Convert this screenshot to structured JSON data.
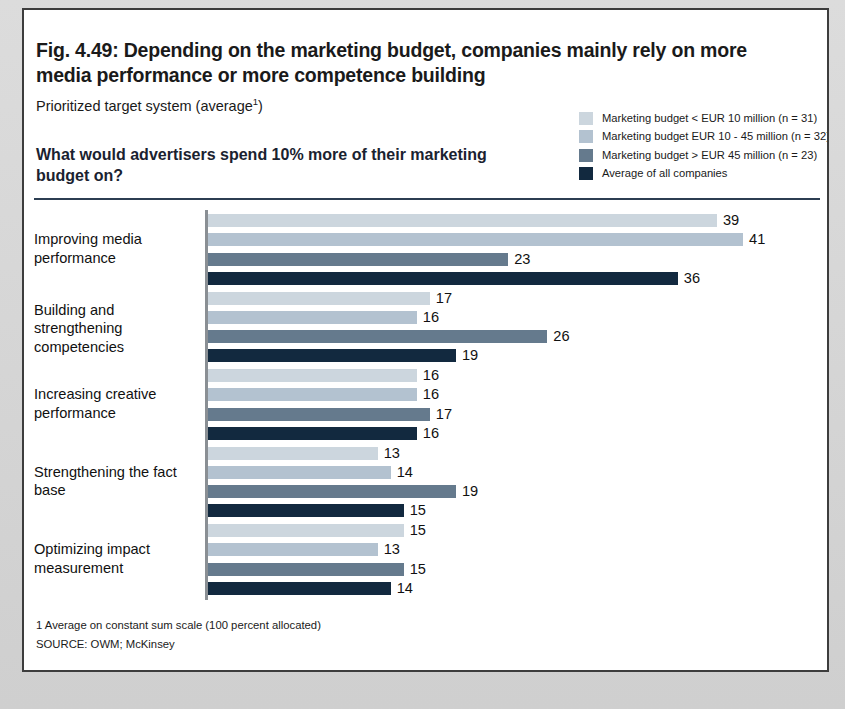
{
  "figure": {
    "title": "Fig. 4.49: Depending on the marketing budget, companies mainly rely on more media performance or more competence building",
    "subtitle_text": "Prioritized target system (average",
    "subtitle_sup": "1",
    "subtitle_tail": ")",
    "question": "What would advertisers spend 10% more of their marketing budget on?",
    "footnote_1": "1 Average on constant sum scale (100 percent allocated)",
    "footnote_source": "SOURCE: OWM; McKinsey"
  },
  "colors": {
    "series_1": "#ccd6de",
    "series_2": "#b3c2d0",
    "series_3": "#657a8d",
    "series_4": "#12293f",
    "divider": "#2c3e52",
    "axis": "#8a8f94",
    "card_border": "#3d3d3d",
    "page_background": "#d9d9d9"
  },
  "chart_data": {
    "type": "bar",
    "orientation": "horizontal",
    "title": "Fig. 4.49: Depending on the marketing budget, companies mainly rely on more media performance or more competence building",
    "subtitle": "Prioritized target system (average1)",
    "question": "What would advertisers spend 10% more of their marketing budget on?",
    "xlabel": "",
    "ylabel": "",
    "xlim": [
      0,
      45
    ],
    "grid": false,
    "legend_position": "top-right",
    "categories": [
      "Improving media performance",
      "Building and strengthening competencies",
      "Increasing creative performance",
      "Strengthening the fact base",
      "Optimizing impact measurement"
    ],
    "series": [
      {
        "name": "Marketing budget < EUR 10 million (n = 31)",
        "color": "#ccd6de",
        "values": [
          39,
          17,
          16,
          13,
          15
        ]
      },
      {
        "name": "Marketing budget EUR 10 - 45 million (n = 32)",
        "color": "#b3c2d0",
        "values": [
          41,
          16,
          16,
          14,
          13
        ]
      },
      {
        "name": "Marketing budget > EUR 45 million (n = 23)",
        "color": "#657a8d",
        "values": [
          23,
          26,
          17,
          19,
          15
        ]
      },
      {
        "name": "Average of all companies",
        "color": "#12293f",
        "values": [
          36,
          19,
          16,
          15,
          14
        ]
      }
    ],
    "footnotes": [
      "1 Average on constant sum scale (100 percent allocated)",
      "SOURCE: OWM; McKinsey"
    ]
  }
}
